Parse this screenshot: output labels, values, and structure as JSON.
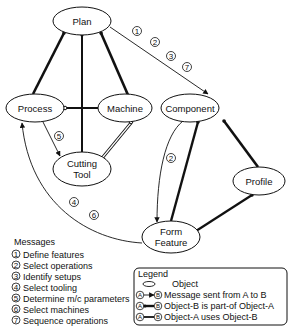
{
  "nodes": {
    "plan": {
      "label": "Plan",
      "cx": 82,
      "cy": 21,
      "rx": 29,
      "ry": 14
    },
    "process": {
      "label": "Process",
      "cx": 35,
      "cy": 108,
      "rx": 29,
      "ry": 14
    },
    "machine": {
      "label": "Machine",
      "cx": 125,
      "cy": 108,
      "rx": 27,
      "ry": 14
    },
    "cutting_tool": {
      "label_line1": "Cutting",
      "label_line2": "Tool",
      "cx": 82,
      "cy": 169,
      "rx": 29,
      "ry": 17
    },
    "component": {
      "label": "Component",
      "cx": 190,
      "cy": 108,
      "rx": 29,
      "ry": 14
    },
    "profile": {
      "label": "Profile",
      "cx": 259,
      "cy": 181,
      "rx": 26,
      "ry": 14
    },
    "form_feature": {
      "label_line1": "Form",
      "label_line2": "Feature",
      "cx": 171,
      "cy": 237,
      "rx": 29,
      "ry": 16
    }
  },
  "message_badges": {
    "plan_component": [
      "1",
      "2",
      "3",
      "7"
    ],
    "process_cutting_tool": [
      "5"
    ],
    "component_form_feature": [
      "2"
    ],
    "form_feature_process": [
      "4",
      "6"
    ]
  },
  "messages": {
    "title": "Messages",
    "items": [
      {
        "num": "1",
        "text": "Define features"
      },
      {
        "num": "2",
        "text": "Select operations"
      },
      {
        "num": "3",
        "text": "Identify setups"
      },
      {
        "num": "4",
        "text": "Select tooling"
      },
      {
        "num": "5",
        "text": "Determine m/c parameters"
      },
      {
        "num": "6",
        "text": "Select machines"
      },
      {
        "num": "7",
        "text": "Sequence operations"
      }
    ]
  },
  "legend": {
    "title": "Legend",
    "items": [
      {
        "symbol": "ellipse",
        "text": "Object"
      },
      {
        "symbol": "message-arrow",
        "a": "A",
        "b": "B",
        "text": "Message sent from A to B"
      },
      {
        "symbol": "part-of",
        "a": "A",
        "b": "B",
        "text": "Object-B is part-of Object-A"
      },
      {
        "symbol": "uses",
        "a": "A",
        "b": "B",
        "text": "Object-A uses Object-B"
      }
    ]
  }
}
